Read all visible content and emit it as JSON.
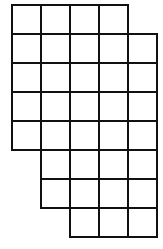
{
  "diagram": {
    "type": "grid-shape",
    "origin": {
      "x": 11,
      "y": 4
    },
    "cell_size": 29,
    "line_color": "#111111",
    "rows": [
      {
        "row": 0,
        "start_col": 0,
        "end_col": 3
      },
      {
        "row": 1,
        "start_col": 0,
        "end_col": 4
      },
      {
        "row": 2,
        "start_col": 0,
        "end_col": 4
      },
      {
        "row": 3,
        "start_col": 0,
        "end_col": 4
      },
      {
        "row": 4,
        "start_col": 0,
        "end_col": 4
      },
      {
        "row": 5,
        "start_col": 1,
        "end_col": 4
      },
      {
        "row": 6,
        "start_col": 1,
        "end_col": 4
      },
      {
        "row": 7,
        "start_col": 2,
        "end_col": 4
      }
    ]
  }
}
